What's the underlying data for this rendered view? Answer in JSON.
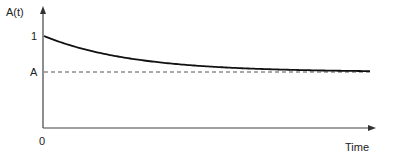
{
  "chart_data": {
    "type": "line",
    "title": "",
    "xlabel": "Time",
    "ylabel": "A(t)",
    "x_tick_labels": [
      "0"
    ],
    "y_tick_labels": [
      "1",
      "A"
    ],
    "grid": false,
    "legend": null,
    "series": [
      {
        "name": "A(t)",
        "style": "solid",
        "description": "Exponential decay from 1 toward asymptote A",
        "x": [
          0,
          0.1,
          0.2,
          0.3,
          0.4,
          0.5,
          0.6,
          0.7,
          0.8,
          0.9,
          1.0
        ],
        "values": [
          1.0,
          0.82,
          0.69,
          0.6,
          0.53,
          0.48,
          0.45,
          0.43,
          0.41,
          0.4,
          0.39
        ]
      },
      {
        "name": "A (asymptote)",
        "style": "dashed",
        "x": [
          0,
          1.0
        ],
        "values": [
          0.36,
          0.36
        ]
      }
    ],
    "annotations": []
  },
  "labels": {
    "y_axis": "A(t)",
    "y_tick_one": "1",
    "y_tick_A": "A",
    "x_origin": "0",
    "x_axis": "Time"
  }
}
